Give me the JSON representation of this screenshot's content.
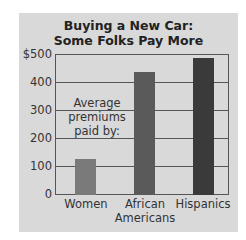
{
  "chart_data": {
    "type": "bar",
    "title": "Buying a New Car: Some Folks Pay More",
    "title_lines": [
      "Buying a New Car:",
      "Some Folks Pay More"
    ],
    "categories": [
      "Women",
      "African Americans",
      "Hispanics"
    ],
    "category_lines": [
      [
        "Women"
      ],
      [
        "African",
        "Americans"
      ],
      [
        "Hispanics"
      ]
    ],
    "values": [
      128,
      435,
      485
    ],
    "annotation_lines": [
      "Average",
      "premiums",
      "paid by:"
    ],
    "xlabel": "",
    "ylabel": "",
    "ylim": [
      0,
      500
    ],
    "yticks": [
      "$500",
      "400",
      "300",
      "200",
      "100",
      "0"
    ],
    "ytick_values": [
      500,
      400,
      300,
      200,
      100,
      0
    ],
    "grid": true,
    "legend": null,
    "colors": [
      "#7a7a7a",
      "#5a5a5a",
      "#3a3a3a"
    ],
    "background": "#d9d9d9"
  }
}
